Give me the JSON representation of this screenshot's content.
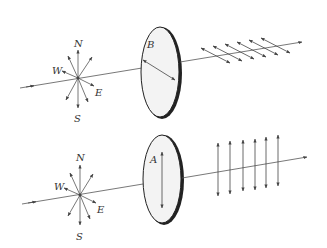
{
  "diagram": {
    "colors": {
      "line": "#444444",
      "lens_fill": "#f2f2f2",
      "lens_edge": "#222222"
    },
    "panels": [
      {
        "id": "top",
        "compass": {
          "N": "N",
          "S": "S",
          "W": "W",
          "E": "E"
        },
        "polarizer_label": "B",
        "polarizer_axis": "diagonal",
        "output_wave": "diagonal polarized arrows",
        "output_arrow_count": 6
      },
      {
        "id": "bottom",
        "compass": {
          "N": "N",
          "S": "S",
          "W": "W",
          "E": "E"
        },
        "polarizer_label": "A",
        "polarizer_axis": "vertical",
        "output_wave": "vertical polarized arrows",
        "output_arrow_count": 6
      }
    ]
  }
}
